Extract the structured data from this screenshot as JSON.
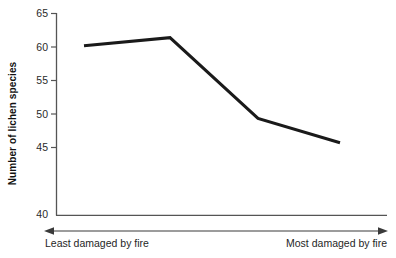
{
  "chart_data": {
    "type": "line",
    "title": "",
    "xlabel": "",
    "ylabel": "Number of lichen species",
    "ylim": [
      40,
      65
    ],
    "yticks": [
      40,
      45,
      50,
      55,
      60,
      65
    ],
    "ytick_labels": [
      "40",
      "45",
      "50",
      "55",
      "60",
      "65"
    ],
    "grid": false,
    "legend": "none",
    "x_axis_is_ordinal_gradient": true,
    "x_gradient_start_label": "Least damaged by fire",
    "x_gradient_end_label": "Most damaged by fire",
    "x": [
      1,
      2,
      3,
      4
    ],
    "series": [
      {
        "name": "Number of lichen species",
        "values": [
          61,
          62,
          52,
          49
        ],
        "color": "#1a1a1a"
      }
    ],
    "points": [
      {
        "x": 1,
        "y": 61
      },
      {
        "x": 2,
        "y": 62
      },
      {
        "x": 3,
        "y": 52
      },
      {
        "x": 4,
        "y": 49
      }
    ]
  },
  "axes": {
    "y_title": "Number of lichen species",
    "ticks": [
      {
        "value": 65,
        "label": "65"
      },
      {
        "value": 60,
        "label": "60"
      },
      {
        "value": 55,
        "label": "55"
      },
      {
        "value": 50,
        "label": "50"
      },
      {
        "value": 45,
        "label": "45"
      },
      {
        "value": 40,
        "label": "40"
      }
    ]
  },
  "gradient_arrow": {
    "left_label": "Least damaged by fire",
    "right_label": "Most damaged by fire"
  },
  "colors": {
    "line": "#1a1a1a",
    "axis": "#555555",
    "text": "#1a1a1a",
    "background": "#ffffff"
  }
}
